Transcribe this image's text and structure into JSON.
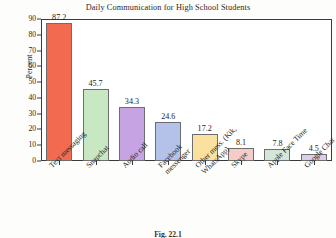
{
  "figure": {
    "caption": "Fig. 22.1"
  },
  "chart_data": {
    "type": "bar",
    "title": "Daily Communication for High School Students",
    "xlabel": "",
    "ylabel": "Percent",
    "ylim": [
      0,
      90
    ],
    "yticks": [
      0,
      10,
      20,
      30,
      40,
      50,
      60,
      70,
      80,
      90
    ],
    "grid": false,
    "legend": false,
    "categories": [
      "Text messaging",
      "Snapchat",
      "Audio call",
      "Facebook\nmessenger",
      "Other mess. (Kik,\nWhatsApp)",
      "Skype",
      "Apple Face Time",
      "Google Chat"
    ],
    "values": [
      87.2,
      45.7,
      34.3,
      24.6,
      17.2,
      8.1,
      7.8,
      4.5
    ],
    "bar_colors": [
      "#F26A50",
      "#C8E8C4",
      "#C6A3E2",
      "#B4C1E8",
      "#FAE1A0",
      "#F5CCC8",
      "#D2E6DA",
      "#DACEE8"
    ],
    "bar_edge_color": "#6d6d6d",
    "axis_color": "#3a3a3a"
  }
}
